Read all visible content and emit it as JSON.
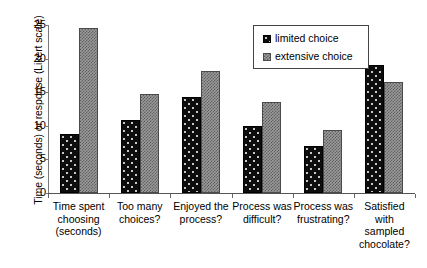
{
  "chart_data": {
    "type": "bar",
    "title": "",
    "xlabel": "",
    "ylabel": "Time (seconds) or response (Likert scale)",
    "ylim": [
      0,
      25
    ],
    "yticks": [
      0,
      5,
      10,
      15,
      20,
      25
    ],
    "ytick_labels": [
      "0",
      "5",
      "10",
      "15",
      "20",
      "25"
    ],
    "grid": false,
    "legend_position": "top-right",
    "categories": [
      "Time spent choosing (seconds)",
      "Too many choices?",
      "Enjoyed the process?",
      "Process was difficult?",
      "Process was frustrating?",
      "Satisfied with sampled chocolate?"
    ],
    "category_lines": [
      [
        "Time spent",
        "choosing",
        "(seconds)"
      ],
      [
        "Too many",
        "choices?"
      ],
      [
        "Enjoyed the",
        "process?"
      ],
      [
        "Process was",
        "difficult?"
      ],
      [
        "Process was",
        "frustrating?"
      ],
      [
        "Satisfied",
        "with",
        "sampled",
        "chocolate?"
      ]
    ],
    "series": [
      {
        "name": "limited choice",
        "color": "#0d0d0d",
        "pattern": "dotted",
        "values": [
          8.8,
          10.9,
          14.3,
          10.0,
          7.0,
          19.0
        ]
      },
      {
        "name": "extensive choice",
        "color": "#9a9a9a",
        "pattern": "checkered",
        "values": [
          24.5,
          14.8,
          18.2,
          13.5,
          9.4,
          16.5
        ]
      }
    ]
  },
  "legend": {
    "entries": [
      {
        "label": "limited choice"
      },
      {
        "label": "extensive choice"
      }
    ]
  },
  "axes": {
    "y_title": "Time (seconds) or response (Likert scale)"
  }
}
